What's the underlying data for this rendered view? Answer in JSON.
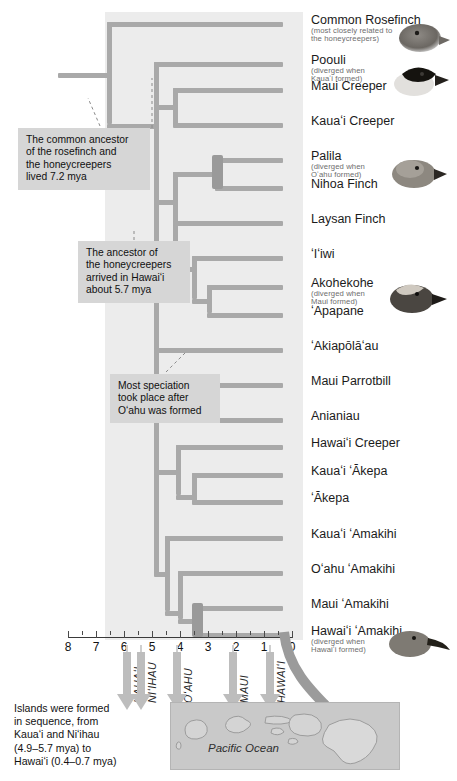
{
  "figure": {
    "type": "phylogenetic-tree",
    "background_color": "#ececec",
    "branch_color": "#a9a9a9",
    "callout_color": "#d6d6d6"
  },
  "leaves": [
    {
      "id": "common-rosefinch",
      "label": "Common Rosefinch",
      "sub": [
        "(most closely related to",
        "the honeycreepers)"
      ],
      "y": 22,
      "tip_x": 280,
      "has_photo": true
    },
    {
      "id": "poouli",
      "label": "Poouli",
      "sub": [
        "(diverged when",
        "Kauaʻi formed)"
      ],
      "y": 62,
      "tip_x": 280,
      "has_photo": true
    },
    {
      "id": "maui-creeper",
      "label": "Maui Creeper",
      "sub": [],
      "y": 88,
      "tip_x": 280,
      "has_photo": false
    },
    {
      "id": "kauai-creeper",
      "label": "Kauaʻi Creeper",
      "sub": [],
      "y": 123,
      "tip_x": 280,
      "has_photo": false
    },
    {
      "id": "palila",
      "label": "Palila",
      "sub": [
        "(diverged when",
        "Oʻahu formed)"
      ],
      "y": 158,
      "tip_x": 280,
      "has_photo": true
    },
    {
      "id": "nihoa-finch",
      "label": "Nihoa Finch",
      "sub": [],
      "y": 186,
      "tip_x": 280,
      "has_photo": false
    },
    {
      "id": "laysan-finch",
      "label": "Laysan Finch",
      "sub": [],
      "y": 221,
      "tip_x": 280,
      "has_photo": false
    },
    {
      "id": "iiwi",
      "label": "ʻIʻiwi",
      "sub": [],
      "y": 256,
      "tip_x": 280,
      "has_photo": false
    },
    {
      "id": "akohekohe",
      "label": "Akohekohe",
      "sub": [
        "(diverged when",
        "Maui formed)"
      ],
      "y": 285,
      "tip_x": 280,
      "has_photo": true
    },
    {
      "id": "apapane",
      "label": "ʻApapane",
      "sub": [],
      "y": 313,
      "tip_x": 280,
      "has_photo": false
    },
    {
      "id": "akiapolaau",
      "label": "ʻAkiapōlāʻau",
      "sub": [],
      "y": 348,
      "tip_x": 280,
      "has_photo": false
    },
    {
      "id": "maui-parrotbill",
      "label": "Maui Parrotbill",
      "sub": [],
      "y": 383,
      "tip_x": 280,
      "has_photo": false
    },
    {
      "id": "anianiau",
      "label": "Anianiau",
      "sub": [],
      "y": 418,
      "tip_x": 280,
      "has_photo": false
    },
    {
      "id": "hawaii-creeper",
      "label": "Hawaiʻi Creeper",
      "sub": [],
      "y": 445,
      "tip_x": 280,
      "has_photo": false
    },
    {
      "id": "kauai-akepa",
      "label": "Kauaʻi ʻĀkepa",
      "sub": [],
      "y": 473,
      "tip_x": 280,
      "has_photo": false
    },
    {
      "id": "akepa",
      "label": "ʻĀkepa",
      "sub": [],
      "y": 500,
      "tip_x": 280,
      "has_photo": false
    },
    {
      "id": "kauai-amakihi",
      "label": "Kauaʻi ʻAmakihi",
      "sub": [],
      "y": 536,
      "tip_x": 280,
      "has_photo": false
    },
    {
      "id": "oahu-amakihi",
      "label": "Oʻahu ʻAmakihi",
      "sub": [],
      "y": 571,
      "tip_x": 280,
      "has_photo": false
    },
    {
      "id": "maui-amakihi",
      "label": "Maui ʻAmakihi",
      "sub": [],
      "y": 606,
      "tip_x": 280,
      "has_photo": false
    },
    {
      "id": "hawaii-amakihi",
      "label": "Hawaiʻi ʻAmakihi",
      "sub": [
        "(diverged when",
        "Hawaiʻi formed)"
      ],
      "y": 633,
      "tip_x": 280,
      "has_photo": true
    }
  ],
  "callouts": [
    {
      "id": "rosefinch-ancestor",
      "lines": [
        "The common ancestor",
        "of the rosefinch and",
        "the honeycreepers",
        "lived 7.2 mya"
      ],
      "x": 18,
      "y": 128,
      "w": 132,
      "h": 54
    },
    {
      "id": "honeycreeper-arrival",
      "lines": [
        "The ancestor of",
        "the honeycreepers",
        "arrived in Hawaiʻi",
        "about 5.7 mya"
      ],
      "x": 78,
      "y": 241,
      "w": 112,
      "h": 54
    },
    {
      "id": "speciation-after-oahu",
      "lines": [
        "Most speciation",
        "took place after",
        "Oʻahu was formed"
      ],
      "x": 110,
      "y": 374,
      "w": 110,
      "h": 42
    }
  ],
  "axis": {
    "title": "",
    "unit": "mya",
    "ticks_major": [
      8,
      7,
      6,
      5,
      4,
      3,
      2,
      1,
      0
    ],
    "ticks_minor": [
      7.5,
      6.5,
      5.5,
      4.5,
      3.5,
      2.5,
      1.5,
      0.5
    ],
    "x_left": 68,
    "x_right": 292,
    "direction": "right-to-left"
  },
  "islands": [
    {
      "name": "KAUAʻI",
      "mya": 5.9,
      "arrow": true
    },
    {
      "name": "NIʻIHAU",
      "mya": 5.4,
      "arrow": true
    },
    {
      "name": "OʻAHU",
      "mya": 4.1,
      "arrow": true
    },
    {
      "name": "MAUI",
      "mya": 2.1,
      "arrow": true
    },
    {
      "name": "HAWAIʻI",
      "mya": 0.8,
      "arrow": true
    }
  ],
  "map": {
    "ocean_label": "Pacific Ocean",
    "note_lines": [
      "Islands were formed",
      "in sequence, from",
      "Kauaʻi and Niʻihau",
      "(4.9–5.7 mya) to",
      "Hawaiʻi (0.4–0.7 mya)"
    ]
  },
  "chart_data": {
    "type": "tree",
    "xlabel": "Millions of years ago (mya)",
    "xlim": [
      8,
      0
    ],
    "grid": false,
    "legend": "none",
    "taxa": [
      "Common Rosefinch",
      "Poouli",
      "Maui Creeper",
      "Kauaʻi Creeper",
      "Palila",
      "Nihoa Finch",
      "Laysan Finch",
      "ʻIʻiwi",
      "Akohekohe",
      "ʻApapane",
      "ʻAkiapōlāʻau",
      "Maui Parrotbill",
      "Anianiau",
      "Hawaiʻi Creeper",
      "Kauaʻi ʻĀkepa",
      "ʻĀkepa",
      "Kauaʻi ʻAmakihi",
      "Oʻahu ʻAmakihi",
      "Maui ʻAmakihi",
      "Hawaiʻi ʻAmakihi"
    ],
    "divergence_events": [
      {
        "label": "rosefinch / honeycreepers split",
        "mya": 7.2
      },
      {
        "label": "honeycreeper ancestor arrival in Hawaiʻi",
        "mya": 5.7
      },
      {
        "label": "Poouli diverged when Kauaʻi formed",
        "mya": 5.0
      },
      {
        "label": "Palila diverged when Oʻahu formed",
        "mya": 3.8
      },
      {
        "label": "Akohekohe diverged when Maui formed",
        "mya": 1.9
      },
      {
        "label": "Hawaiʻi ʻAmakihi diverged when Hawaiʻi formed",
        "mya": 0.6
      }
    ],
    "island_formation": [
      {
        "island": "Kauaʻi",
        "mya_range": [
          4.9,
          5.7
        ]
      },
      {
        "island": "Niʻihau",
        "mya_range": [
          4.9,
          5.7
        ]
      },
      {
        "island": "Oʻahu",
        "mya": 4.1
      },
      {
        "island": "Maui",
        "mya": 2.1
      },
      {
        "island": "Hawaiʻi",
        "mya_range": [
          0.4,
          0.7
        ]
      }
    ]
  }
}
